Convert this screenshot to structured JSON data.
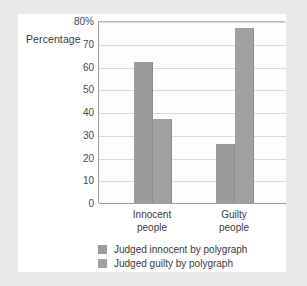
{
  "chart_data": {
    "type": "bar",
    "title": "",
    "xlabel": "",
    "ylabel": "Percentage",
    "ylim": [
      0,
      80
    ],
    "grid": true,
    "legend_position": "bottom",
    "categories": [
      "Innocent people",
      "Guilty people"
    ],
    "category_lines": [
      [
        "Innocent",
        "people"
      ],
      [
        "Guilty",
        "people"
      ]
    ],
    "series": [
      {
        "name": "Judged innocent by polygraph",
        "values": [
          62,
          26
        ],
        "color": "#9b9b9b"
      },
      {
        "name": "Judged guilty by polygraph",
        "values": [
          37,
          77
        ],
        "color": "#a0a0a0"
      }
    ],
    "yticks": [
      {
        "value": 80,
        "label": "80%"
      },
      {
        "value": 70,
        "label": "70"
      },
      {
        "value": 60,
        "label": "60"
      },
      {
        "value": 50,
        "label": "50"
      },
      {
        "value": 40,
        "label": "40"
      },
      {
        "value": 30,
        "label": "30"
      },
      {
        "value": 20,
        "label": "20"
      },
      {
        "value": 10,
        "label": "10"
      },
      {
        "value": 0,
        "label": "0"
      }
    ]
  },
  "colors": {
    "page_background": "#e9e9e7",
    "card_background": "#ffffff",
    "plot_background": "#fdfdfd",
    "gridline": "#d9d9d9",
    "axis": "#9d9d9d",
    "bar": "#9b9b9b",
    "text": "#3a3a3a"
  }
}
